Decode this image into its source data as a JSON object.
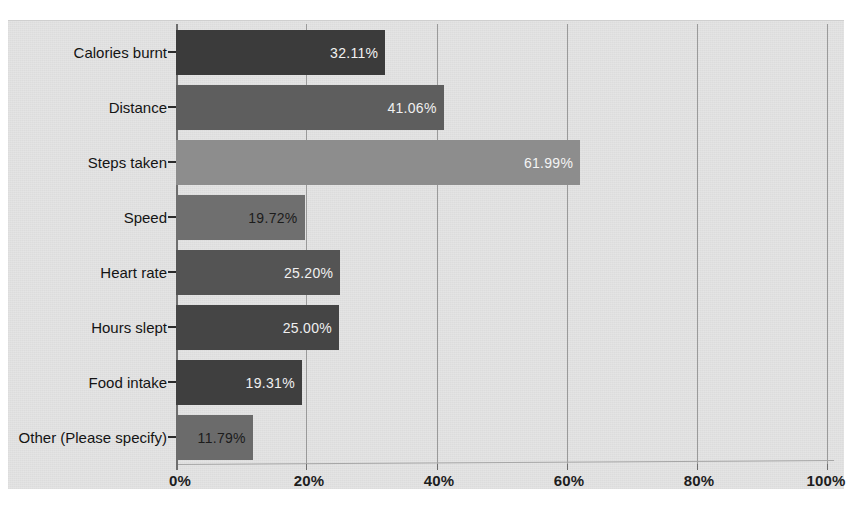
{
  "chart_data": {
    "type": "bar",
    "orientation": "horizontal",
    "title": "",
    "subtitle": "",
    "xlabel": "",
    "ylabel": "",
    "xlim": [
      0,
      100
    ],
    "grid": true,
    "legend": null,
    "xtick_labels": [
      "0%",
      "20%",
      "40%",
      "60%",
      "80%",
      "100%"
    ],
    "xticks": [
      0,
      20,
      40,
      60,
      80,
      100
    ],
    "categories": [
      "Calories burnt",
      "Distance",
      "Steps taken",
      "Speed",
      "Heart rate",
      "Hours slept",
      "Food intake",
      "Other (Please specify)"
    ],
    "values": [
      32.11,
      41.06,
      61.99,
      19.72,
      25.2,
      25.0,
      19.31,
      11.79
    ],
    "data_labels": [
      "32.11%",
      "41.06%",
      "61.99%",
      "19.72%",
      "25.20%",
      "25.00%",
      "19.31%",
      "11.79%"
    ],
    "bar_colors": [
      "#3b3b3b",
      "#5e5e5e",
      "#8d8d8d",
      "#6f6f6f",
      "#545454",
      "#454545",
      "#3f3f3f",
      "#6b6b6b"
    ],
    "label_text_colors": [
      "#f2f2f2",
      "#f0f0f0",
      "#f4f4f4",
      "#1c1c1c",
      "#f0f0f0",
      "#efefef",
      "#f0f0f0",
      "#1c1c1c"
    ],
    "plot_background": "#e4e4e4",
    "gridline_color": "#9a9a9a",
    "axis_color": "#6e6e6e"
  }
}
